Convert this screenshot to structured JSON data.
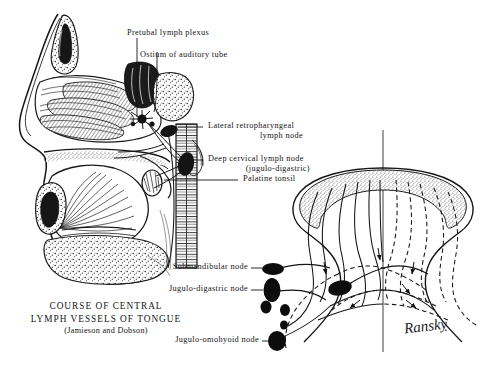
{
  "figure": {
    "caption_line1": "COURSE OF CENTRAL",
    "caption_line2": "LYMPH VESSELS OF TONGUE",
    "caption_line3": "(Jamieson and Dobson)",
    "signature": "Ranskỵ",
    "background_color": "#ffffff",
    "ink_color": "#111111"
  },
  "labels": {
    "pretubal_plexus": "Pretubal lymph plexus",
    "ostium_auditory_tube": "Ostium of auditory tube",
    "lateral_retropharyngeal_1": "Lateral retropharyngeal",
    "lateral_retropharyngeal_2": "lymph node",
    "deep_cervical_1": "Deep cervical lymph node",
    "deep_cervical_2": "(jugulo-digastric)",
    "palatine_tonsil": "Palatine tonsil",
    "submandibular_node": "Submandibular node",
    "jugulo_digastric_node": "Jugulo-digastric node",
    "jugulo_omohyoid_node": "Jugulo-omohyoid node"
  },
  "panels": {
    "left_panel_name": "sagittal-head-section",
    "right_panel_name": "tongue-dorsum-lymphatics"
  }
}
